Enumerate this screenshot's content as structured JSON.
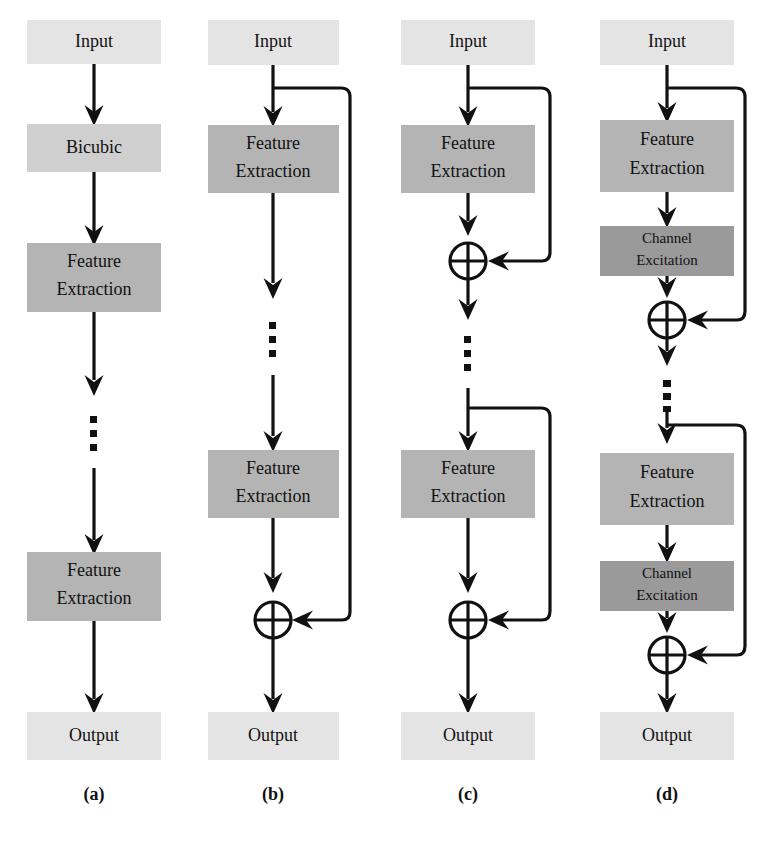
{
  "figure": {
    "type": "diagram",
    "background": "#ffffff",
    "palette": {
      "input_output_fill": "#e4e4e4",
      "bicubic_fill": "#cfcfcf",
      "feature_extraction_fill": "#b4b4b4",
      "channel_excitation_fill": "#9a9a9a",
      "stroke": "#111111"
    }
  },
  "columns": [
    {
      "id": "a",
      "label": "(a)",
      "blocks": [
        {
          "name": "input",
          "text": "Input",
          "kind": "io"
        },
        {
          "name": "bicubic",
          "text": "Bicubic",
          "kind": "bicubic"
        },
        {
          "name": "feature-extraction-1",
          "text": "Feature\nExtraction",
          "line1": "Feature",
          "line2": "Extraction",
          "kind": "feature"
        },
        {
          "name": "vertical-ellipsis",
          "text": "⋮",
          "kind": "ellipsis"
        },
        {
          "name": "feature-extraction-2",
          "text": "Feature\nExtraction",
          "line1": "Feature",
          "line2": "Extraction",
          "kind": "feature"
        },
        {
          "name": "output",
          "text": "Output",
          "kind": "io"
        }
      ],
      "skip_connections": []
    },
    {
      "id": "b",
      "label": "(b)",
      "blocks": [
        {
          "name": "input",
          "text": "Input",
          "kind": "io"
        },
        {
          "name": "feature-extraction-1",
          "line1": "Feature",
          "line2": "Extraction",
          "kind": "feature"
        },
        {
          "name": "vertical-ellipsis",
          "text": "⋮",
          "kind": "ellipsis"
        },
        {
          "name": "feature-extraction-2",
          "line1": "Feature",
          "line2": "Extraction",
          "kind": "feature"
        },
        {
          "name": "global-sum",
          "text": "⊕",
          "kind": "sum"
        },
        {
          "name": "output",
          "text": "Output",
          "kind": "io"
        }
      ],
      "skip_connections": [
        {
          "name": "global-skip",
          "from": "after-input",
          "to": "global-sum"
        }
      ]
    },
    {
      "id": "c",
      "label": "(c)",
      "blocks": [
        {
          "name": "input",
          "text": "Input",
          "kind": "io"
        },
        {
          "name": "feature-extraction-1",
          "line1": "Feature",
          "line2": "Extraction",
          "kind": "feature"
        },
        {
          "name": "local-sum-1",
          "text": "⊕",
          "kind": "sum"
        },
        {
          "name": "vertical-ellipsis",
          "text": "⋮",
          "kind": "ellipsis"
        },
        {
          "name": "feature-extraction-2",
          "line1": "Feature",
          "line2": "Extraction",
          "kind": "feature"
        },
        {
          "name": "local-sum-2",
          "text": "⊕",
          "kind": "sum"
        },
        {
          "name": "output",
          "text": "Output",
          "kind": "io"
        }
      ],
      "skip_connections": [
        {
          "name": "local-skip-1",
          "from": "after-input",
          "to": "local-sum-1"
        },
        {
          "name": "local-skip-2",
          "from": "before-feature-extraction-2",
          "to": "local-sum-2"
        }
      ]
    },
    {
      "id": "d",
      "label": "(d)",
      "blocks": [
        {
          "name": "input",
          "text": "Input",
          "kind": "io"
        },
        {
          "name": "feature-extraction-1",
          "line1": "Feature",
          "line2": "Extraction",
          "kind": "feature"
        },
        {
          "name": "channel-excitation-1",
          "line1": "Channel",
          "line2": "Excitation",
          "kind": "excitation"
        },
        {
          "name": "local-sum-1",
          "text": "⊕",
          "kind": "sum"
        },
        {
          "name": "vertical-dashed-ellipsis",
          "text": "⋮",
          "kind": "dashed-ellipsis"
        },
        {
          "name": "feature-extraction-2",
          "line1": "Feature",
          "line2": "Extraction",
          "kind": "feature"
        },
        {
          "name": "channel-excitation-2",
          "line1": "Channel",
          "line2": "Excitation",
          "kind": "excitation"
        },
        {
          "name": "local-sum-2",
          "text": "⊕",
          "kind": "sum"
        },
        {
          "name": "output",
          "text": "Output",
          "kind": "io"
        }
      ],
      "skip_connections": [
        {
          "name": "local-skip-1",
          "from": "after-input",
          "to": "local-sum-1"
        },
        {
          "name": "local-skip-2",
          "from": "before-feature-extraction-2",
          "to": "local-sum-2"
        }
      ]
    }
  ],
  "text": {
    "input": "Input",
    "output": "Output",
    "bicubic": "Bicubic",
    "feature_line1": "Feature",
    "feature_line2": "Extraction",
    "channel_line1": "Channel",
    "channel_line2": "Excitation",
    "label_a": "(a)",
    "label_b": "(b)",
    "label_c": "(c)",
    "label_d": "(d)"
  }
}
